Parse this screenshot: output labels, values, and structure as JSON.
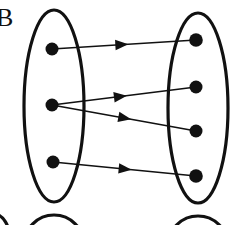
{
  "figure": {
    "label_partial": "B",
    "canvas": {
      "width": 231,
      "height": 225
    },
    "stroke_color": "#111111",
    "background_color": "#ffffff",
    "dot_color": "#111111"
  },
  "sets": [
    {
      "id": "domain-set",
      "name": "left-set",
      "cx": 54,
      "cy": 106,
      "rx": 30,
      "ry": 96,
      "stroke_width": 3.2
    },
    {
      "id": "codomain-set",
      "name": "right-set",
      "cx": 198,
      "cy": 108,
      "rx": 30,
      "ry": 95,
      "stroke_width": 3.2
    }
  ],
  "nodes": [
    {
      "id": "L1",
      "set": "domain-set",
      "cx": 52,
      "cy": 49,
      "r": 6.5
    },
    {
      "id": "L2",
      "set": "domain-set",
      "cx": 52,
      "cy": 105,
      "r": 6.5
    },
    {
      "id": "L3",
      "set": "domain-set",
      "cx": 53,
      "cy": 162,
      "r": 6.5
    },
    {
      "id": "R1",
      "set": "codomain-set",
      "cx": 196,
      "cy": 40,
      "r": 6.8
    },
    {
      "id": "R2",
      "set": "codomain-set",
      "cx": 196,
      "cy": 87,
      "r": 6.5
    },
    {
      "id": "R3",
      "set": "codomain-set",
      "cx": 196,
      "cy": 131,
      "r": 6.5
    },
    {
      "id": "R4",
      "set": "codomain-set",
      "cx": 196,
      "cy": 176,
      "r": 6.8
    }
  ],
  "edges": [
    {
      "id": "E1",
      "from": "L1",
      "to": "R1",
      "x1": 52,
      "y1": 49,
      "x2": 196,
      "y2": 40,
      "arrow_t": 0.53
    },
    {
      "id": "E2",
      "from": "L2",
      "to": "R2",
      "x1": 52,
      "y1": 105,
      "x2": 196,
      "y2": 87,
      "arrow_t": 0.52
    },
    {
      "id": "E3",
      "from": "L2",
      "to": "R3",
      "x1": 52,
      "y1": 105,
      "x2": 196,
      "y2": 131,
      "arrow_t": 0.55
    },
    {
      "id": "E4",
      "from": "L3",
      "to": "R4",
      "x1": 53,
      "y1": 162,
      "x2": 196,
      "y2": 176,
      "arrow_t": 0.55
    }
  ],
  "cut_shapes": [
    {
      "id": "C1",
      "name": "cut-ellipse-bottom-left",
      "cx": 54,
      "cy": 245,
      "rx": 30,
      "ry": 30,
      "stroke_width": 3.2
    },
    {
      "id": "C2",
      "name": "cut-ellipse-bottom-center",
      "cx": -6,
      "cy": 240,
      "rx": 16,
      "ry": 26,
      "stroke_width": 3.2
    },
    {
      "id": "C3",
      "name": "cut-ellipse-bottom-right",
      "cx": 198,
      "cy": 246,
      "rx": 30,
      "ry": 30,
      "stroke_width": 3.2
    }
  ]
}
